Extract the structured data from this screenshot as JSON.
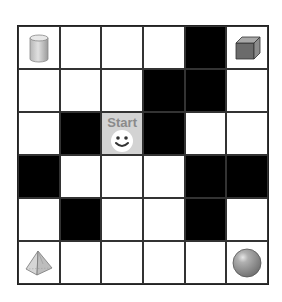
{
  "grid": {
    "rows": 6,
    "cols": 6,
    "colors": {
      "wall": "#000000",
      "open": "#ffffff",
      "start": "#d3d3d3",
      "line": "#333333"
    },
    "cells": [
      [
        "cylinder",
        "open",
        "open",
        "open",
        "wall",
        "cube"
      ],
      [
        "open",
        "open",
        "open",
        "wall",
        "wall",
        "open"
      ],
      [
        "open",
        "wall",
        "start",
        "wall",
        "open",
        "open"
      ],
      [
        "wall",
        "open",
        "open",
        "open",
        "wall",
        "wall"
      ],
      [
        "open",
        "wall",
        "open",
        "open",
        "wall",
        "open"
      ],
      [
        "pyramid",
        "open",
        "open",
        "open",
        "open",
        "sphere"
      ]
    ]
  },
  "start": {
    "label": "Start",
    "row": 2,
    "col": 2,
    "icon": "smiley-face-icon"
  },
  "objects": [
    {
      "name": "cylinder",
      "row": 0,
      "col": 0,
      "icon": "cylinder-icon"
    },
    {
      "name": "cube",
      "row": 0,
      "col": 5,
      "icon": "cube-icon"
    },
    {
      "name": "pyramid",
      "row": 5,
      "col": 0,
      "icon": "pyramid-icon"
    },
    {
      "name": "sphere",
      "row": 5,
      "col": 5,
      "icon": "sphere-icon"
    }
  ]
}
